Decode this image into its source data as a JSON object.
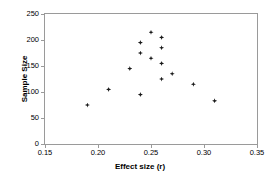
{
  "chart_data": {
    "type": "scatter",
    "title": "",
    "xlabel": "Effect size (r)",
    "ylabel": "Sample Size",
    "xlim": [
      0.15,
      0.35
    ],
    "ylim": [
      0,
      250
    ],
    "xticks": [
      0.15,
      0.2,
      0.25,
      0.3,
      0.35
    ],
    "xticklabels": [
      "0.15",
      "0.20",
      "0.25",
      "0.30",
      "0.35"
    ],
    "yticks": [
      0,
      50,
      100,
      150,
      200,
      250
    ],
    "yticklabels": [
      "0",
      "50",
      "100",
      "150",
      "200",
      "250"
    ],
    "grid": false,
    "legend": null,
    "marker": {
      "shape": "diamond",
      "color": "#1a1a1a",
      "size": 5
    },
    "n_points": 16,
    "points": [
      {
        "x": 0.19,
        "y": 75
      },
      {
        "x": 0.21,
        "y": 105
      },
      {
        "x": 0.23,
        "y": 145
      },
      {
        "x": 0.24,
        "y": 195
      },
      {
        "x": 0.24,
        "y": 175
      },
      {
        "x": 0.24,
        "y": 95
      },
      {
        "x": 0.25,
        "y": 215
      },
      {
        "x": 0.25,
        "y": 165
      },
      {
        "x": 0.26,
        "y": 205
      },
      {
        "x": 0.26,
        "y": 185
      },
      {
        "x": 0.26,
        "y": 155
      },
      {
        "x": 0.26,
        "y": 125
      },
      {
        "x": 0.27,
        "y": 135
      },
      {
        "x": 0.29,
        "y": 115
      },
      {
        "x": 0.31,
        "y": 83
      }
    ],
    "series": [
      {
        "name": "studies",
        "x": [
          0.19,
          0.21,
          0.23,
          0.24,
          0.24,
          0.24,
          0.25,
          0.25,
          0.26,
          0.26,
          0.26,
          0.26,
          0.27,
          0.29,
          0.31
        ],
        "y": [
          75,
          105,
          145,
          195,
          175,
          95,
          215,
          165,
          205,
          185,
          155,
          125,
          135,
          115,
          83
        ]
      }
    ]
  },
  "colors": {
    "marker": "#1a1a1a",
    "axis": "#9a9a9a",
    "text": "#000000",
    "background": "#ffffff"
  }
}
